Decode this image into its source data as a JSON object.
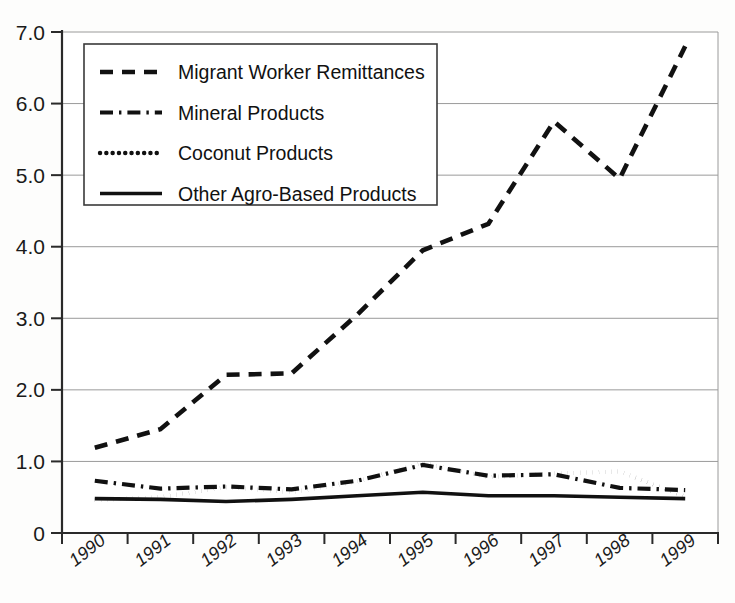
{
  "chart_data": {
    "type": "line",
    "title": "",
    "subtitle": "",
    "xlabel": "",
    "ylabel": "",
    "categories": [
      "1990",
      "1991",
      "1992",
      "1993",
      "1994",
      "1995",
      "1996",
      "1997",
      "1998",
      "1999"
    ],
    "x_tick_labels": [
      "1990",
      "1991",
      "1992",
      "1993",
      "1994",
      "1995",
      "1996",
      "1997",
      "1998",
      "1999"
    ],
    "y_tick_labels": [
      "0",
      "1.0",
      "2.0",
      "3.0",
      "4.0",
      "5.0",
      "6.0",
      "7.0"
    ],
    "y_tick_values": [
      0,
      1,
      2,
      3,
      4,
      5,
      6,
      7
    ],
    "ylim": [
      0,
      7
    ],
    "grid": "horizontal",
    "legend_position": "top-left-inside",
    "series": [
      {
        "name": "Migrant Worker Remittances",
        "dash": "dashed",
        "values": [
          1.19,
          1.45,
          2.21,
          2.23,
          3.05,
          3.95,
          4.32,
          5.75,
          4.95,
          6.8
        ]
      },
      {
        "name": "Mineral Products",
        "dash": "dash-dot",
        "values": [
          0.73,
          0.62,
          0.65,
          0.61,
          0.73,
          0.95,
          0.8,
          0.82,
          0.63,
          0.6
        ]
      },
      {
        "name": "Coconut Products",
        "dash": "dotted",
        "values": [
          0.46,
          0.5,
          0.64,
          0.57,
          0.72,
          0.98,
          0.78,
          0.83,
          0.86,
          0.51
        ]
      },
      {
        "name": "Other Agro-Based Products",
        "dash": "solid",
        "values": [
          0.48,
          0.47,
          0.44,
          0.47,
          0.52,
          0.57,
          0.52,
          0.52,
          0.5,
          0.48
        ]
      }
    ]
  },
  "legend": {
    "entries": [
      {
        "label": "Migrant Worker Remittances",
        "swatch": "dashed-line-swatch"
      },
      {
        "label": "Mineral Products",
        "swatch": "dash-dot-line-swatch"
      },
      {
        "label": "Coconut Products",
        "swatch": "dotted-line-swatch"
      },
      {
        "label": "Other Agro-Based Products",
        "swatch": "solid-line-swatch"
      }
    ]
  },
  "colors": {
    "series_line": "#111111",
    "gridline": "#9a9a9a",
    "axis": "#2a2a2a",
    "background": "#fdfdfc",
    "legend_border": "#3a3a3a"
  }
}
